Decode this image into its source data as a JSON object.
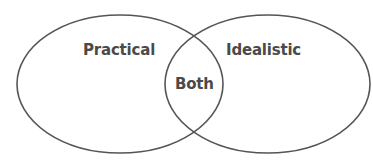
{
  "diagram": {
    "type": "venn",
    "sets": [
      {
        "id": "left",
        "label": "Practical"
      },
      {
        "id": "right",
        "label": "Idealistic"
      }
    ],
    "intersection": {
      "label": "Both"
    },
    "stroke_color": "#555555",
    "text_color": "#4a4a4a",
    "background": "#ffffff"
  }
}
